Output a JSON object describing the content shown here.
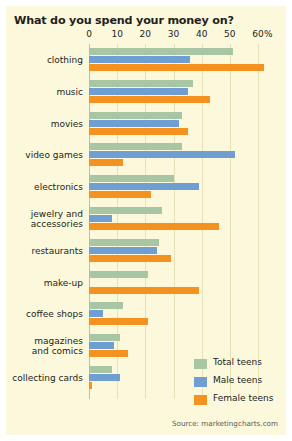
{
  "chart_data": {
    "type": "bar",
    "orientation": "horizontal",
    "title": "What do you spend your money on?",
    "xlabel": "%",
    "ylabel": "",
    "xlim": [
      0,
      60
    ],
    "xticks": [
      0,
      10,
      20,
      30,
      40,
      50,
      60
    ],
    "xtick_labels": [
      "0",
      "10",
      "20",
      "30",
      "40",
      "50",
      "60"
    ],
    "grid": true,
    "legend_position": "bottom-right",
    "categories": [
      "clothing",
      "music",
      "movies",
      "video games",
      "electronics",
      "jewelry and\naccessories",
      "restaurants",
      "make-up",
      "coffee shops",
      "magazines\nand comics",
      "collecting cards"
    ],
    "series": [
      {
        "name": "Total teens",
        "color": "#a9c6a4",
        "values": [
          51,
          37,
          33,
          33,
          30,
          26,
          25,
          21,
          12,
          11,
          8
        ]
      },
      {
        "name": "Male teens",
        "color": "#6e9ed2",
        "values": [
          36,
          35,
          32,
          52,
          39,
          8,
          24,
          0,
          5,
          9,
          11
        ]
      },
      {
        "name": "Female teens",
        "color": "#f4921f",
        "values": [
          62,
          43,
          35,
          12,
          22,
          46,
          29,
          39,
          21,
          14,
          1
        ]
      }
    ],
    "source": "Source: marketingcharts.com"
  },
  "legend": {
    "items": [
      {
        "label": "Total teens",
        "color": "#a9c6a4"
      },
      {
        "label": "Male teens",
        "color": "#6e9ed2"
      },
      {
        "label": "Female teens",
        "color": "#f4921f"
      }
    ]
  },
  "axis": {
    "percent_symbol": "%"
  }
}
